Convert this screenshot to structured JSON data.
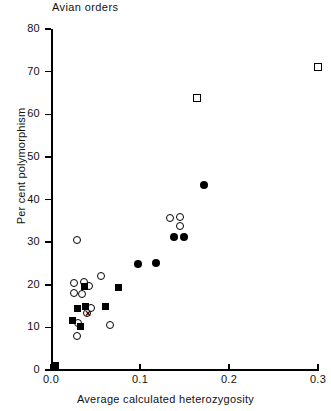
{
  "chart_data": {
    "type": "scatter",
    "title": "Avian orders",
    "xlabel": "Average calculated heterozygosity",
    "ylabel": "Per cent polymorphism",
    "xlim": [
      0.0,
      0.3
    ],
    "ylim": [
      0,
      80
    ],
    "xticks": [
      "0.0",
      "0.1",
      "0.2",
      "0.3"
    ],
    "xtick_values": [
      0.0,
      0.1,
      0.2,
      0.3
    ],
    "yticks": [
      "0",
      "10",
      "20",
      "30",
      "40",
      "50",
      "60",
      "70",
      "80"
    ],
    "ytick_values": [
      0,
      10,
      20,
      30,
      40,
      50,
      60,
      70,
      80
    ],
    "grid": false,
    "legend": null,
    "series": [
      {
        "name": "open-circle",
        "marker": "open-circle",
        "points": [
          {
            "x": 0.0292,
            "y": 30.4
          },
          {
            "x": 0.0258,
            "y": 20.5
          },
          {
            "x": 0.0371,
            "y": 20.6
          },
          {
            "x": 0.0427,
            "y": 19.6
          },
          {
            "x": 0.0562,
            "y": 22.0
          },
          {
            "x": 0.0258,
            "y": 18.0
          },
          {
            "x": 0.0348,
            "y": 17.8
          },
          {
            "x": 0.0449,
            "y": 14.6
          },
          {
            "x": 0.0404,
            "y": 13.3
          },
          {
            "x": 0.0303,
            "y": 11.1
          },
          {
            "x": 0.0662,
            "y": 10.5
          },
          {
            "x": 0.0292,
            "y": 7.9
          },
          {
            "x": 0.1337,
            "y": 35.6
          },
          {
            "x": 0.1449,
            "y": 35.8
          },
          {
            "x": 0.1449,
            "y": 33.9
          }
        ]
      },
      {
        "name": "filled-circle",
        "marker": "filled-circle",
        "points": [
          {
            "x": 0.0978,
            "y": 24.9
          },
          {
            "x": 0.118,
            "y": 25.2
          },
          {
            "x": 0.1382,
            "y": 31.1
          },
          {
            "x": 0.1494,
            "y": 31.1
          },
          {
            "x": 0.1719,
            "y": 43.4
          }
        ]
      },
      {
        "name": "filled-square",
        "marker": "filled-square",
        "points": [
          {
            "x": 0.0382,
            "y": 19.5
          },
          {
            "x": 0.0303,
            "y": 14.5
          },
          {
            "x": 0.0393,
            "y": 15.0
          },
          {
            "x": 0.0607,
            "y": 14.8
          },
          {
            "x": 0.0247,
            "y": 11.6
          },
          {
            "x": 0.0337,
            "y": 10.2
          },
          {
            "x": 0.0764,
            "y": 19.4
          }
        ]
      },
      {
        "name": "open-square",
        "marker": "open-square",
        "points": [
          {
            "x": 0.164,
            "y": 63.8
          },
          {
            "x": 0.3,
            "y": 71.0
          }
        ]
      },
      {
        "name": "cross",
        "marker": "cross",
        "points": [
          {
            "x": 0.0416,
            "y": 13.2
          }
        ]
      }
    ]
  }
}
